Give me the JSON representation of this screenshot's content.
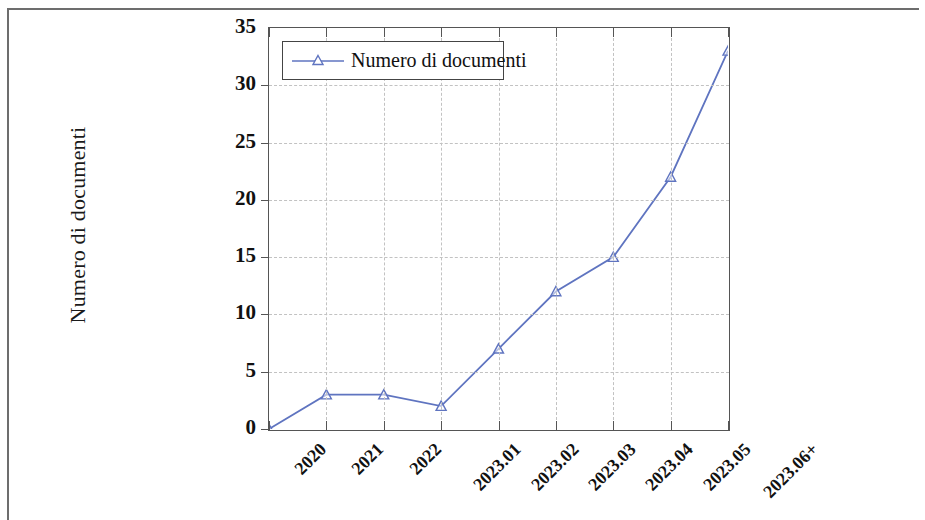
{
  "chart_data": {
    "type": "line",
    "title": "",
    "subtitle": "",
    "xlabel": "",
    "ylabel": "Numero di documenti",
    "categories": [
      "2020",
      "2021",
      "2022",
      "2023.01",
      "2023.02",
      "2023.03",
      "2023.04",
      "2023.05",
      "2023.06+"
    ],
    "series": [
      {
        "name": "Numero di documenti",
        "values": [
          0,
          3,
          3,
          2,
          7,
          12,
          15,
          22,
          33
        ],
        "color": "#5f74c0",
        "marker": "triangle-up"
      }
    ],
    "ylim": [
      0,
      35
    ],
    "yticks": [
      0,
      5,
      10,
      15,
      20,
      25,
      30,
      35
    ],
    "ytick_labels": [
      "0",
      "5",
      "10",
      "15",
      "20",
      "25",
      "30",
      "35"
    ],
    "grid": true,
    "grid_style": "dashed",
    "grid_color": "#c2c2c2",
    "legend": {
      "position": "top-left-inside",
      "entries": [
        "Numero di documenti"
      ]
    },
    "axis_color": "#555555",
    "background": "#ffffff"
  }
}
